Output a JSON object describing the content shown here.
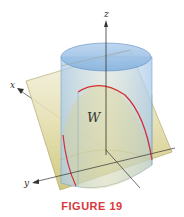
{
  "figure": {
    "caption": "FIGURE 19",
    "region_label": "W",
    "axes": {
      "x": "x",
      "y": "y",
      "z": "z"
    },
    "colors": {
      "caption": "#d9373a",
      "curve": "#d42f2f",
      "cylinder_top": "#8fb8e0",
      "cylinder_side": "#c6dcf0",
      "plane": "#d8d29a",
      "axis": "#333333"
    }
  }
}
